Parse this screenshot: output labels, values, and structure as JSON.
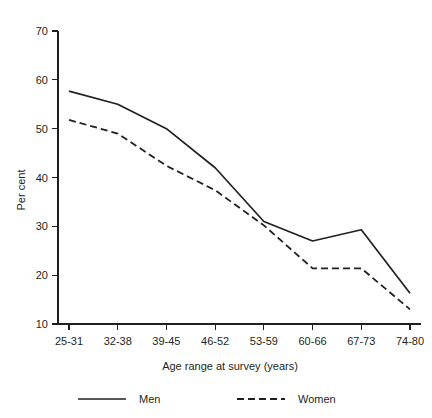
{
  "chart_data": {
    "type": "line",
    "title": "",
    "xlabel": "Age range at survey (years)",
    "ylabel": "Per cent",
    "categories": [
      "25-31",
      "32-38",
      "39-45",
      "46-52",
      "53-59",
      "60-66",
      "67-73",
      "74-80"
    ],
    "yticks": [
      10,
      20,
      30,
      40,
      50,
      60,
      70
    ],
    "ylim": [
      10,
      70
    ],
    "grid": false,
    "legend_position": "bottom",
    "series": [
      {
        "name": "Men",
        "style": "solid",
        "color": "#231f20",
        "values": [
          57.7,
          55.0,
          50.0,
          42.0,
          31.0,
          27.0,
          29.3,
          16.3
        ]
      },
      {
        "name": "Women",
        "style": "dashed",
        "color": "#231f20",
        "values": [
          51.8,
          49.0,
          42.4,
          37.4,
          30.2,
          21.4,
          21.4,
          13.0
        ]
      }
    ]
  }
}
